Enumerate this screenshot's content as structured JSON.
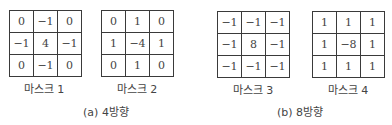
{
  "masks": [
    {
      "label": "마스크 1",
      "rows": [
        [
          "0",
          "−1",
          "0"
        ],
        [
          "−1",
          "4",
          "−1"
        ],
        [
          "0",
          "−1",
          "0"
        ]
      ]
    },
    {
      "label": "마스크 2",
      "rows": [
        [
          "0",
          "1",
          "0"
        ],
        [
          "1",
          "−4",
          "1"
        ],
        [
          "0",
          "1",
          "0"
        ]
      ]
    },
    {
      "label": "마스크 3",
      "rows": [
        [
          "−1",
          "−1",
          "−1"
        ],
        [
          "−1",
          "8",
          "−1"
        ],
        [
          "−1",
          "−1",
          "−1"
        ]
      ]
    },
    {
      "label": "마스크 4",
      "rows": [
        [
          "1",
          "1",
          "1"
        ],
        [
          "1",
          "−8",
          "1"
        ],
        [
          "1",
          "1",
          "1"
        ]
      ]
    }
  ],
  "captions": {
    "a": "(a) 4방향",
    "b": "(b) 8방향"
  }
}
